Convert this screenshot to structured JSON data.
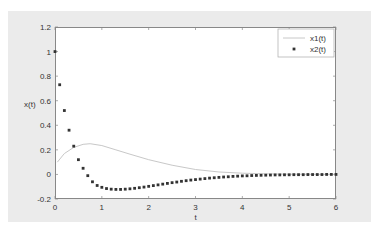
{
  "chart_data": {
    "type": "line",
    "title": "",
    "xlabel": "t",
    "ylabel": "x(t)",
    "xlim": [
      0,
      6
    ],
    "ylim": [
      -0.2,
      1.2
    ],
    "xticks": [
      "0",
      "1",
      "2",
      "3",
      "4",
      "5",
      "6"
    ],
    "yticks": [
      "-0.2",
      "0",
      "0.2",
      "0.4",
      "0.6",
      "0.8",
      "1",
      "1.2"
    ],
    "grid": false,
    "legend_position": "upper right",
    "series": [
      {
        "name": "x1(t)",
        "style": "line",
        "color": "#c8c8c8",
        "x": [
          0.05,
          0.2,
          0.4,
          0.6,
          0.75,
          1.0,
          1.3,
          1.6,
          2.0,
          2.5,
          3.0,
          3.5,
          4.0,
          4.5,
          5.0,
          5.5,
          6.0
        ],
        "y": [
          0.1,
          0.17,
          0.22,
          0.245,
          0.25,
          0.235,
          0.2,
          0.165,
          0.12,
          0.075,
          0.04,
          0.02,
          0.01,
          0.005,
          0.002,
          0.001,
          0.0
        ]
      },
      {
        "name": "x2(t)",
        "style": "markers",
        "color": "#333333",
        "x": [
          0,
          0.1,
          0.2,
          0.3,
          0.4,
          0.5,
          0.6,
          0.7,
          0.8,
          0.9,
          1.0,
          1.1,
          1.2,
          1.3,
          1.4,
          1.5,
          1.6,
          1.7,
          1.8,
          1.9,
          2.0,
          2.1,
          2.2,
          2.3,
          2.4,
          2.5,
          2.6,
          2.7,
          2.8,
          2.9,
          3.0,
          3.1,
          3.2,
          3.3,
          3.4,
          3.5,
          3.6,
          3.7,
          3.8,
          3.9,
          4.0,
          4.1,
          4.2,
          4.3,
          4.4,
          4.5,
          4.6,
          4.7,
          4.8,
          4.9,
          5.0,
          5.1,
          5.2,
          5.3,
          5.4,
          5.5,
          5.6,
          5.7,
          5.8,
          5.9,
          6.0
        ],
        "y": [
          1.0,
          0.73,
          0.52,
          0.36,
          0.23,
          0.12,
          0.05,
          -0.01,
          -0.06,
          -0.09,
          -0.105,
          -0.115,
          -0.12,
          -0.122,
          -0.122,
          -0.12,
          -0.117,
          -0.113,
          -0.108,
          -0.103,
          -0.097,
          -0.091,
          -0.085,
          -0.079,
          -0.073,
          -0.067,
          -0.062,
          -0.056,
          -0.051,
          -0.046,
          -0.042,
          -0.038,
          -0.034,
          -0.03,
          -0.027,
          -0.024,
          -0.021,
          -0.019,
          -0.016,
          -0.014,
          -0.012,
          -0.011,
          -0.009,
          -0.008,
          -0.007,
          -0.006,
          -0.005,
          -0.004,
          -0.004,
          -0.003,
          -0.003,
          -0.002,
          -0.002,
          -0.002,
          -0.001,
          -0.001,
          -0.001,
          -0.001,
          0.0,
          0.0,
          0.0
        ]
      }
    ]
  }
}
